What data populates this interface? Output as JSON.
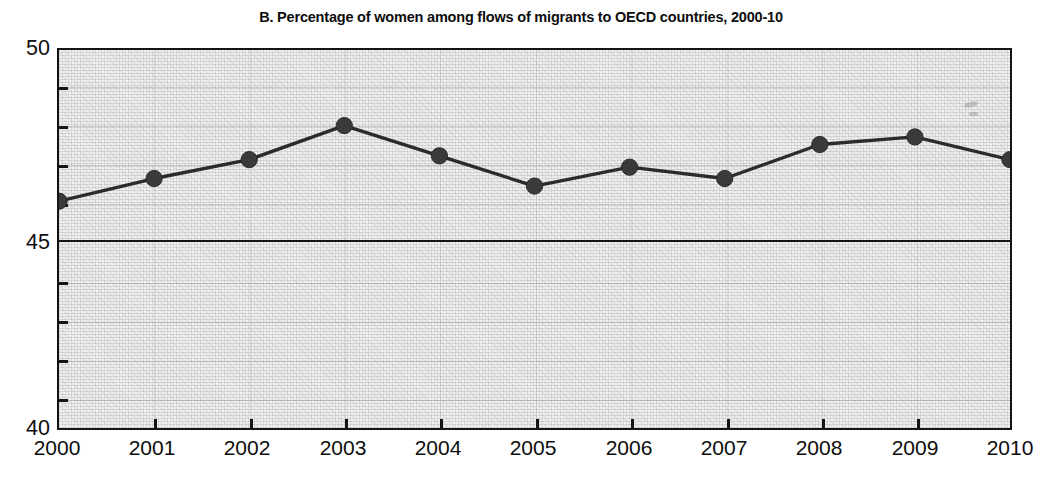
{
  "chart_data": {
    "type": "line",
    "title": "B. Percentage of women among flows of migrants to OECD countries, 2000-10",
    "xlabel": "",
    "ylabel": "",
    "categories": [
      "2000",
      "2001",
      "2002",
      "2003",
      "2004",
      "2005",
      "2006",
      "2007",
      "2008",
      "2009",
      "2010"
    ],
    "x": [
      2000,
      2001,
      2002,
      2003,
      2004,
      2005,
      2006,
      2007,
      2008,
      2009,
      2010
    ],
    "values": [
      46.0,
      46.6,
      47.1,
      48.0,
      47.2,
      46.4,
      46.9,
      46.6,
      47.5,
      47.7,
      47.1
    ],
    "series": [
      {
        "name": "Percentage of women among migrant flows",
        "values": [
          46.0,
          46.6,
          47.1,
          48.0,
          47.2,
          46.4,
          46.9,
          46.6,
          47.5,
          47.7,
          47.1
        ]
      }
    ],
    "ylim": [
      40,
      50
    ],
    "y_major_ticks": [
      40,
      45,
      50
    ],
    "y_major_tick_labels": [
      "40",
      "45",
      "50"
    ],
    "y_minor_ticks": [
      41,
      42,
      43,
      44,
      46,
      47,
      48,
      49
    ],
    "xlim": [
      2000,
      2010
    ],
    "grid": true,
    "grid_orientation": "horizontal",
    "legend": false,
    "legend_position": "none",
    "marker": "circle",
    "line_color": "#2b2b2b",
    "marker_color": "#3a3a3a",
    "plot_background": "#f2f2f2",
    "axis_color": "#141414"
  },
  "figure": {
    "title": "B. Percentage of women among flows of migrants to OECD countries, 2000-10"
  },
  "axis": {
    "y_labels": [
      "50",
      "45",
      "40"
    ],
    "x_labels": [
      "2000",
      "2001",
      "2002",
      "2003",
      "2004",
      "2005",
      "2006",
      "2007",
      "2008",
      "2009",
      "2010"
    ]
  }
}
